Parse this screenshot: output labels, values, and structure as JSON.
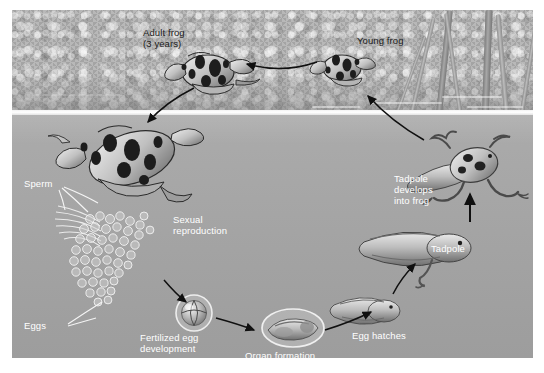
{
  "figure": {
    "scene": {
      "above_water_label": "bank",
      "below_water_label": "pond water"
    },
    "colors": {
      "bank": "#b0b0b0",
      "water": "#a6a6a6",
      "waterline": "#ffffff",
      "label_dark": "#1b1b1b",
      "label_light": "#ffffff",
      "arrow": "#111111",
      "pointer_line": "#ffffff",
      "page_background": "#ffffff"
    }
  },
  "labels": {
    "adult_frog": "Adult frog\n(3 years)",
    "young_frog": "Young frog",
    "sperm": "Sperm",
    "eggs": "Eggs",
    "sexual_reproduction": "Sexual\nreproduction",
    "fertilized_egg": "Fertilized egg\ndevelopment",
    "organ_formation": "Organ formation",
    "egg_hatches": "Egg hatches",
    "tadpole": "Tadpole",
    "tadpole_develops": "Tadpole\ndevelops\ninto frog"
  },
  "stages": [
    {
      "id": "adult-frog",
      "label": "Adult frog (3 years)",
      "habitat": "land"
    },
    {
      "id": "mating-pair",
      "label": "Sexual reproduction",
      "habitat": "water"
    },
    {
      "id": "sperm",
      "label": "Sperm",
      "habitat": "water"
    },
    {
      "id": "eggs",
      "label": "Eggs",
      "habitat": "water"
    },
    {
      "id": "fertilized-egg",
      "label": "Fertilized egg development",
      "habitat": "water"
    },
    {
      "id": "organ-formation",
      "label": "Organ formation",
      "habitat": "water"
    },
    {
      "id": "hatchling-tadpole",
      "label": "Egg hatches",
      "habitat": "water"
    },
    {
      "id": "tadpole",
      "label": "Tadpole",
      "habitat": "water"
    },
    {
      "id": "tadpole-with-legs",
      "label": "Tadpole develops into frog",
      "habitat": "water"
    },
    {
      "id": "young-frog",
      "label": "Young frog",
      "habitat": "land"
    }
  ],
  "arrows": [
    {
      "from": "young-frog",
      "to": "adult-frog"
    },
    {
      "from": "adult-frog",
      "to": "mating-pair"
    },
    {
      "from": "mating-pair",
      "to": "fertilized-egg"
    },
    {
      "from": "fertilized-egg",
      "to": "organ-formation"
    },
    {
      "from": "organ-formation",
      "to": "hatchling-tadpole"
    },
    {
      "from": "hatchling-tadpole",
      "to": "tadpole"
    },
    {
      "from": "tadpole",
      "to": "tadpole-with-legs"
    },
    {
      "from": "tadpole-with-legs",
      "to": "young-frog"
    }
  ]
}
